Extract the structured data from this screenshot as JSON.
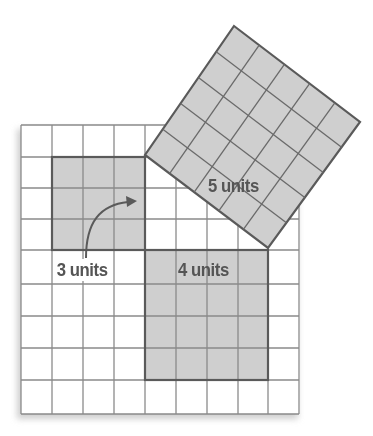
{
  "diagram": {
    "grid": {
      "columns": 9,
      "rows": 9,
      "cell_size_px": 31
    },
    "squares": [
      {
        "id": "small",
        "side_units": 3,
        "label": "3 units"
      },
      {
        "id": "medium",
        "side_units": 4,
        "label": "4 units"
      },
      {
        "id": "large",
        "side_units": 5,
        "label": "5 units",
        "rotated": true
      }
    ],
    "arrow": {
      "description": "curved arrow from 3 units label pointing right into corner"
    },
    "colors": {
      "grid_line": "#8a8a8a",
      "square_fill": "#cfcfcf",
      "square_border": "#5a5a5a",
      "label_text": "#555555",
      "background": "#ffffff",
      "shadow": "#d9d9d9"
    }
  }
}
